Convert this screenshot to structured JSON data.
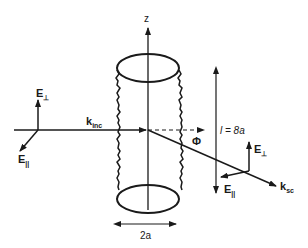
{
  "diagram": {
    "colors": {
      "stroke": "#1a1a1a",
      "background": "#ffffff"
    },
    "labels": {
      "z_axis": "z",
      "k_inc": {
        "main": "k",
        "sub": "inc"
      },
      "k_sc": {
        "main": "k",
        "sub": "sc"
      },
      "phi": "Φ",
      "length": "l = 8a",
      "diameter": "2a",
      "e_perp_incident": {
        "main": "E",
        "sub": "⊥"
      },
      "e_par_incident": {
        "main": "E",
        "sub": "||"
      },
      "e_perp_scattered": {
        "main": "E",
        "sub": "⊥"
      },
      "e_par_scattered": {
        "main": "E",
        "sub": "||"
      }
    }
  }
}
